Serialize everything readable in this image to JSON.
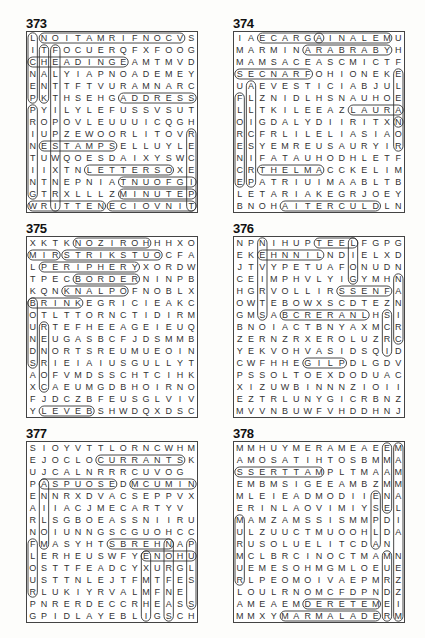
{
  "puzzles": [
    {
      "number": "373",
      "grid": [
        "LNOITAMRIFNOCVS",
        "ITFOCUERQFXFOOG",
        "CHEADINGEAMTMVD",
        "NALYIAPNOADEMEY",
        "ENTTFTVURAMNARC",
        "PKTHSEHGADDRESS",
        "PYILYLEFUSSVSUT",
        "ROPOVLEUUUICQGH",
        "IUPZEWOORLITOVR",
        "NESTAMPSELLUYLE",
        "TUWQOESDAIXYSWC",
        "IIXTNLETTERSOXE",
        "NTNEPNIATNUOFGI",
        "GTRXLLLZMINUTEP",
        "WRITTENECIOVNIT"
      ],
      "circled": [
        {
          "r": 0,
          "c": 1,
          "len": 13,
          "dir": "h"
        },
        {
          "r": 2,
          "c": 0,
          "len": 9,
          "dir": "h"
        },
        {
          "r": 5,
          "c": 8,
          "len": 7,
          "dir": "h"
        },
        {
          "r": 9,
          "c": 1,
          "len": 7,
          "dir": "h"
        },
        {
          "r": 11,
          "c": 5,
          "len": 8,
          "dir": "h"
        },
        {
          "r": 12,
          "c": 8,
          "len": 7,
          "dir": "h"
        },
        {
          "r": 13,
          "c": 8,
          "len": 7,
          "dir": "h"
        },
        {
          "r": 14,
          "c": 0,
          "len": 7,
          "dir": "h"
        },
        {
          "r": 14,
          "c": 7,
          "len": 8,
          "dir": "h"
        },
        {
          "r": 0,
          "c": 0,
          "len": 6,
          "dir": "v"
        },
        {
          "r": 6,
          "c": 0,
          "len": 8,
          "dir": "v"
        },
        {
          "r": 1,
          "c": 1,
          "len": 5,
          "dir": "v"
        },
        {
          "r": 1,
          "c": 2,
          "len": 14,
          "dir": "v"
        },
        {
          "r": 8,
          "c": 14,
          "len": 7,
          "dir": "v"
        }
      ]
    },
    {
      "number": "374",
      "grid": [
        "IAECARGAINALEMU",
        "MARMINARABRABYH",
        "MAMSACEASCMICTF",
        "SECNARFOHIONEKE",
        "UAEVESTICIABJUL",
        "FLZNIDLHSNAUHOE",
        "LLTKILEEAZLAURA",
        "OIGDALYDIIRITXN",
        "RCFRLILELIASIAO",
        "ESYEMREUSAURYIR",
        "NIFATAUHODHLETF",
        "CRTHELMACCKELIM",
        "EPATRIUIMAABLTB",
        "LETARIAKEGRJOEY",
        "BNOHAITERCULDLN"
      ],
      "circled": [
        {
          "r": 0,
          "c": 2,
          "len": 6,
          "dir": "h"
        },
        {
          "r": 0,
          "c": 7,
          "len": 7,
          "dir": "h"
        },
        {
          "r": 1,
          "c": 6,
          "len": 8,
          "dir": "h"
        },
        {
          "r": 3,
          "c": 0,
          "len": 7,
          "dir": "h"
        },
        {
          "r": 6,
          "c": 10,
          "len": 5,
          "dir": "h"
        },
        {
          "r": 11,
          "c": 2,
          "len": 6,
          "dir": "h"
        },
        {
          "r": 14,
          "c": 4,
          "len": 9,
          "dir": "h"
        },
        {
          "r": 5,
          "c": 0,
          "len": 8,
          "dir": "v"
        },
        {
          "r": 4,
          "c": 1,
          "len": 9,
          "dir": "v"
        },
        {
          "r": 3,
          "c": 14,
          "len": 5,
          "dir": "v"
        },
        {
          "r": 7,
          "c": 14,
          "len": 3,
          "dir": "v"
        }
      ]
    },
    {
      "number": "375",
      "grid": [
        "XKTKNOZIROHHHXO",
        "MIRSTRIKSTUOCFA",
        "LPERIPHERYXORDW",
        "TPECBORDERNINPB",
        "KQNKNALPOFNOBLX",
        "BRINKEGRICIEAKC",
        "OTLTTORNCTIDIRM",
        "URTEFHEEAGEIEUQ",
        "NEUGASBCFJDSMMB",
        "DNORTSREUMUEOIN",
        "SRIEIAIUSGULLYT",
        "AOFVMDSSCHTCIHK",
        "XCAEUMGDBHOIRNO",
        "FJDCZBFEUSGLVIV",
        "YLEVEBSHWDQXDSC"
      ],
      "circled": [
        {
          "r": 0,
          "c": 4,
          "len": 7,
          "dir": "h"
        },
        {
          "r": 1,
          "c": 0,
          "len": 3,
          "dir": "h"
        },
        {
          "r": 1,
          "c": 3,
          "len": 9,
          "dir": "h"
        },
        {
          "r": 2,
          "c": 1,
          "len": 9,
          "dir": "h"
        },
        {
          "r": 3,
          "c": 4,
          "len": 6,
          "dir": "h"
        },
        {
          "r": 4,
          "c": 3,
          "len": 6,
          "dir": "h"
        },
        {
          "r": 5,
          "c": 0,
          "len": 5,
          "dir": "h"
        },
        {
          "r": 14,
          "c": 1,
          "len": 5,
          "dir": "h"
        },
        {
          "r": 5,
          "c": 0,
          "len": 6,
          "dir": "v"
        },
        {
          "r": 7,
          "c": 1,
          "len": 6,
          "dir": "v"
        }
      ]
    },
    {
      "number": "376",
      "grid": [
        "NPNIHUPTEELFGPG",
        "EKEHNNILNDIELXD",
        "JTVYPETUAFONUDN",
        "CEIMPHVLYIGYMHN",
        "HGRVOLLIRSSENFA",
        "OWTEBOWXSCDTEZN",
        "GMSABCRERANLHSI",
        "BNOIACTBNYAXMCR",
        "ZERNZRXEROLUZRC",
        "YEKVOHVASIDSQID",
        "CWFHHEGILPDLGDV",
        "PSSOLTOEXDODUAC",
        "XIZUWBINNNZIOII",
        "EZTRLUNYGICRBNZ",
        "MVVNBUWFVHDDHNJ"
      ],
      "circled": [
        {
          "r": 0,
          "c": 7,
          "len": 4,
          "dir": "h"
        },
        {
          "r": 1,
          "c": 2,
          "len": 6,
          "dir": "h"
        },
        {
          "r": 4,
          "c": 9,
          "len": 5,
          "dir": "h"
        },
        {
          "r": 6,
          "c": 4,
          "len": 8,
          "dir": "h"
        },
        {
          "r": 10,
          "c": 6,
          "len": 4,
          "dir": "h"
        },
        {
          "r": 0,
          "c": 10,
          "len": 4,
          "dir": "v"
        },
        {
          "r": 0,
          "c": 2,
          "len": 7,
          "dir": "v"
        },
        {
          "r": 3,
          "c": 14,
          "len": 6,
          "dir": "v"
        },
        {
          "r": 6,
          "c": 13,
          "len": 4,
          "dir": "v"
        }
      ]
    },
    {
      "number": "377",
      "grid": [
        "SIOYVTTLORNCWHM",
        "EJOCLOCURRANTSK",
        "UJCALNRRRCUVOG",
        "PASPUOSEDMCUMIN",
        "ENNRXDVACSEPPVX",
        "AIIACJMECARTYV",
        "RLSGBOEASSNIIRU",
        "NOIUNNGSCGUOHCC",
        "FMASYHTSBREHNAP",
        "LERHEUSWFYENOHU",
        "OSTTFEADCYXURGL",
        "USTTNLEJTFMTFES",
        "RLUKIYRVALMFNE",
        "PNRERDECCRHEASS",
        "GPIDLAYEBLIGSCH"
      ],
      "circled": [
        {
          "r": 1,
          "c": 6,
          "len": 8,
          "dir": "h"
        },
        {
          "r": 3,
          "c": 9,
          "len": 6,
          "dir": "h"
        },
        {
          "r": 3,
          "c": 1,
          "len": 7,
          "dir": "h"
        },
        {
          "r": 8,
          "c": 7,
          "len": 6,
          "dir": "h"
        },
        {
          "r": 9,
          "c": 10,
          "len": 5,
          "dir": "h"
        },
        {
          "r": 3,
          "c": 1,
          "len": 6,
          "dir": "v"
        },
        {
          "r": 8,
          "c": 0,
          "len": 5,
          "dir": "v"
        },
        {
          "r": 8,
          "c": 14,
          "len": 6,
          "dir": "v"
        },
        {
          "r": 9,
          "c": 10,
          "len": 6,
          "dir": "v"
        },
        {
          "r": 8,
          "c": 12,
          "len": 7,
          "dir": "v"
        }
      ]
    },
    {
      "number": "378",
      "grid": [
        "MMHUYMERAMEAEEM",
        "AMOSATIHTOSBMMA",
        "SSERTTAMPLTMAAM",
        "EMBMSIGEEAMBZMM",
        "MLEIEADMODIIENA",
        "ERINLAOVIMIYSEL",
        "MAMZAMSSISMMPDI",
        "ULZUUCTMUOOHLDA",
        "RUSOLUELITCDAN",
        "MCLBRCINOCTMAMN",
        "UEMESOHMGMLOEUE",
        "RLPEOMOIVAEPMRZ",
        "LOULRNOMCFDPNDZ",
        "AMEAEMDERETEMEI",
        "MMXYMARMALADERM"
      ],
      "circled": [
        {
          "r": 2,
          "c": 0,
          "len": 8,
          "dir": "h"
        },
        {
          "r": 13,
          "c": 6,
          "len": 7,
          "dir": "h"
        },
        {
          "r": 14,
          "c": 4,
          "len": 9,
          "dir": "h"
        },
        {
          "r": 0,
          "c": 14,
          "len": 15,
          "dir": "v"
        },
        {
          "r": 0,
          "c": 13,
          "len": 6,
          "dir": "v"
        },
        {
          "r": 6,
          "c": 0,
          "len": 6,
          "dir": "v"
        },
        {
          "r": 9,
          "c": 13,
          "len": 6,
          "dir": "v"
        },
        {
          "r": 4,
          "c": 12,
          "len": 5,
          "dir": "v"
        }
      ]
    }
  ]
}
